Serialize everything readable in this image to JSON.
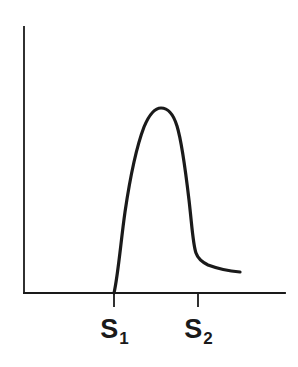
{
  "figure": {
    "background_color": "#ffffff",
    "ink_color": "#1a1a1a",
    "width": 298,
    "height": 367,
    "title": "",
    "subtitle": ""
  },
  "axes": {
    "y_axis_name": "y-axis",
    "x_axis_name": "x-axis",
    "x_label": "",
    "y_label": "",
    "origin_x": 24,
    "origin_y": 293,
    "y_top": 27,
    "x_right": 285,
    "axis_color": "#1a1a1a",
    "axis_width": 1.8
  },
  "ticks": [
    {
      "id": "s1",
      "label_base": "S",
      "label_sub": "1",
      "x": 114,
      "length": 13
    },
    {
      "id": "s2",
      "label_base": "S",
      "label_sub": "2",
      "x": 198,
      "length": 13
    }
  ],
  "curve": {
    "name": "peak-curve",
    "color": "#1a1a1a",
    "stroke_width": 3.2,
    "path": "M 114 293 C 118 276 121 240 125 212 C 130 178 136 148 144 127 C 149 115 155 108 161 108 C 168 108 173 113 177 126 C 181 139 185 166 189 200 C 192 226 193 245 196 253 C 198 259 202 262 208 265 C 216 268 229 271 240 272"
  },
  "chart_data": {
    "type": "line",
    "title": "",
    "xlabel": "",
    "ylabel": "",
    "grid": false,
    "legend": "none",
    "annotations": [
      "S1",
      "S2"
    ],
    "x_tick_labels": [
      "S₁",
      "S₂"
    ],
    "x_tick_positions": [
      114,
      198
    ],
    "xlim": [
      24,
      285
    ],
    "ylim": [
      0,
      266
    ],
    "series": [
      {
        "name": "peak",
        "x": [
          114,
          120,
          126,
          132,
          138,
          144,
          150,
          156,
          161,
          166,
          172,
          178,
          183,
          188,
          193,
          196,
          200,
          206,
          214,
          224,
          234,
          240
        ],
        "y": [
          0,
          62,
          94,
          128,
          152,
          170,
          180,
          185,
          185,
          183,
          175,
          160,
          132,
          100,
          62,
          42,
          35,
          30,
          26,
          23,
          21,
          21
        ]
      }
    ]
  }
}
